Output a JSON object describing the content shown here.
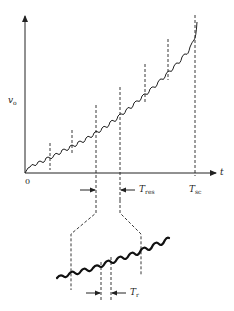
{
  "figure": {
    "y_axis_label": "v",
    "y_axis_label_sub": "o",
    "x_axis_label": "t",
    "origin_label": "0",
    "t_res_label": "T",
    "t_res_sub": "res",
    "t_sc_label": "T",
    "t_sc_sub": "sc",
    "t_r_label": "T",
    "t_r_sub": "r",
    "colors": {
      "ink": "#222222",
      "background": "#ffffff"
    }
  }
}
